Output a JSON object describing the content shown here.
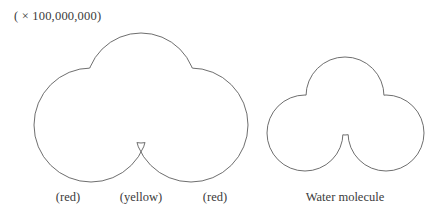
{
  "figure": {
    "scale_note": "( × 100,000,000)",
    "stroke_color": "#5e5e5e",
    "fill_color": "#ffffff",
    "background_color": "#ffffff"
  },
  "left_model": {
    "name": "water-molecule-labeled",
    "captions": {
      "left_atom": "(red)",
      "center_atom": "(yellow)",
      "right_atom": "(red)"
    },
    "atoms": [
      {
        "role": "hydrogen-left",
        "color_label": "red",
        "cx": 91,
        "cy": 125,
        "r": 57
      },
      {
        "role": "oxygen-center",
        "color_label": "yellow",
        "cx": 141,
        "cy": 88,
        "r": 55
      },
      {
        "role": "hydrogen-right",
        "color_label": "red",
        "cx": 191,
        "cy": 125,
        "r": 57
      }
    ]
  },
  "right_model": {
    "name": "water-molecule-plain",
    "caption": "Water molecule",
    "atoms": [
      {
        "role": "hydrogen-left",
        "cx": 305,
        "cy": 133,
        "r": 38
      },
      {
        "role": "oxygen-center",
        "cx": 345,
        "cy": 96,
        "r": 39
      },
      {
        "role": "hydrogen-right",
        "cx": 386,
        "cy": 133,
        "r": 38
      }
    ]
  }
}
